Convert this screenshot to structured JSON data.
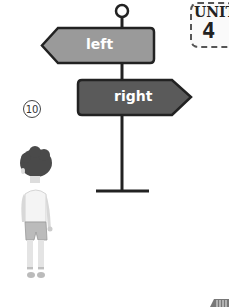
{
  "signpost": {
    "left_sign": {
      "label": "left",
      "direction": "left",
      "color": "#9a9a9a"
    },
    "right_sign": {
      "label": "right",
      "direction": "right",
      "color": "#5a5a5a"
    }
  },
  "unit_badge": {
    "label": "UNIT",
    "number": "4"
  },
  "item_number": "⑩",
  "corner_decoration": {
    "description": "striped page-corner tab"
  }
}
